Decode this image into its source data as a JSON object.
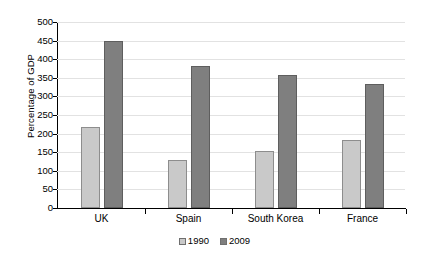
{
  "chart_data": {
    "type": "bar",
    "title": "",
    "xlabel": "",
    "ylabel": "Percentage of GDP",
    "categories": [
      "UK",
      "Spain",
      "South Korea",
      "France"
    ],
    "series": [
      {
        "name": "1990",
        "color": "#c9c9c9",
        "values": [
          218,
          130,
          152,
          183
        ]
      },
      {
        "name": "2009",
        "color": "#7f7f7f",
        "values": [
          448,
          383,
          358,
          333
        ]
      }
    ],
    "ylim": [
      0,
      500
    ],
    "ytick_step": 50,
    "ytick_labels": [
      "500",
      "450",
      "400",
      "350",
      "300",
      "250",
      "200",
      "150",
      "100",
      "50",
      "0"
    ],
    "grid": true,
    "legend_position": "bottom"
  },
  "legend": {
    "items": [
      {
        "label": "1990",
        "swatch": "legend-swatch-1990"
      },
      {
        "label": "2009",
        "swatch": "legend-swatch-2009"
      }
    ]
  }
}
